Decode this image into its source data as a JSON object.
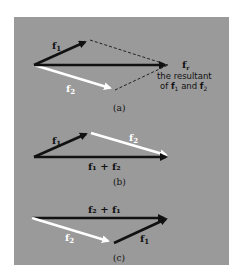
{
  "figure": {
    "panel_color": "#9a9a9a",
    "colors": {
      "dark_vector": "#111111",
      "light_vector": "#ffffff",
      "dashed": "#222222"
    },
    "a": {
      "caption": "(a)",
      "f1_label": "f",
      "f1_sub": "1",
      "f2_label": "f",
      "f2_sub": "2",
      "resultant_label": "f",
      "resultant_sub": "r",
      "note_line1": "the resultant",
      "note_line2_pre": "of ",
      "note_f1": "f",
      "note_f1_sub": "1",
      "note_and": " and ",
      "note_f2": "f",
      "note_f2_sub": "2"
    },
    "b": {
      "caption": "(b)",
      "f1_label": "f",
      "f1_sub": "1",
      "f2_label": "f",
      "f2_sub": "2",
      "sum_label": "f₁ + f₂"
    },
    "c": {
      "caption": "(c)",
      "f2_label": "f",
      "f2_sub": "2",
      "f1_label": "f",
      "f1_sub": "1",
      "sum_label": "f₂ + f₁"
    }
  }
}
